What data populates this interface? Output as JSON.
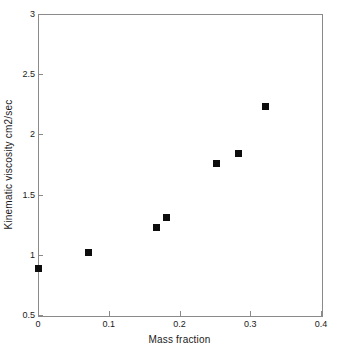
{
  "chart_data": {
    "type": "scatter",
    "title": "",
    "xlabel": "Mass fraction",
    "ylabel": "Kinematic viscosity cm2/sec",
    "xlim": [
      0,
      0.4
    ],
    "ylim": [
      0.5,
      3
    ],
    "xticks": [
      "0",
      "0.1",
      "0.2",
      "0.3",
      "0.4"
    ],
    "xtick_values": [
      0,
      0.1,
      0.2,
      0.3,
      0.4
    ],
    "yticks": [
      "3",
      "2.5",
      "2",
      "1.5",
      "1",
      "0.5"
    ],
    "ytick_values": [
      3,
      2.5,
      2,
      1.5,
      1,
      0.5
    ],
    "grid": false,
    "legend": null,
    "marker_color": "#0d0d0d",
    "marker_shape": "square",
    "axis_color": "#8a8a8a",
    "background_color": "#ffffff",
    "series": [
      {
        "name": "Kinematic viscosity",
        "points": [
          {
            "x": 0.0,
            "y": 0.89
          },
          {
            "x": 0.071,
            "y": 1.02
          },
          {
            "x": 0.168,
            "y": 1.23
          },
          {
            "x": 0.182,
            "y": 1.31
          },
          {
            "x": 0.253,
            "y": 1.76
          },
          {
            "x": 0.283,
            "y": 1.84
          },
          {
            "x": 0.322,
            "y": 2.23
          }
        ]
      }
    ]
  }
}
